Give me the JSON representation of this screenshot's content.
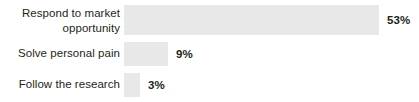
{
  "chart_data": {
    "type": "bar",
    "orientation": "horizontal",
    "title": "",
    "subtitle": "",
    "xlabel": "",
    "ylabel": "",
    "grid": false,
    "legend": false,
    "axis_visible": false,
    "value_suffix": "%",
    "xlim": [
      0,
      53
    ],
    "categories": [
      "Respond to market\nopportunity",
      "Solve personal pain",
      "Follow the research"
    ],
    "values": [
      53,
      9,
      3
    ],
    "value_labels": [
      "53%",
      "9%",
      "3%"
    ],
    "bar_color": "#e8e8e8",
    "label_color": "#231f20",
    "value_color": "#231f20",
    "background": "#ffffff"
  },
  "rows": [
    {
      "label": "Respond to market\nopportunity",
      "value": 53,
      "value_label": "53%",
      "bar_px": 255,
      "value_left_px": 387
    },
    {
      "label": "Solve personal pain",
      "value": 9,
      "value_label": "9%",
      "bar_px": 44,
      "value_left_px": 176
    },
    {
      "label": "Follow the research",
      "value": 3,
      "value_label": "3%",
      "bar_px": 16,
      "value_left_px": 148
    }
  ]
}
